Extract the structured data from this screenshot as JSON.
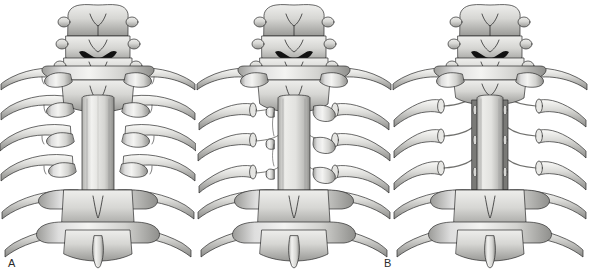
{
  "figure": {
    "background_color": "#ffffff",
    "ink_color": "#2b2b2b",
    "bone_light": "#f2f2f0",
    "bone_mid": "#c9c9c6",
    "bone_shadow": "#8d8d8a",
    "dark_fill": "#111111",
    "width": 589,
    "height": 278,
    "panel_count": 3
  },
  "panels": [
    {
      "id": "a",
      "label": "A",
      "caption": "Intact posterior thoracic spine with ribs and costotransverse joints",
      "ribs_per_side": 6,
      "vertebrae_visible": 8,
      "ribs_resected": false,
      "transverse_processes_removed": false,
      "nerve_roots_exposed": false,
      "central_structure": "spinous process column"
    },
    {
      "id": "b",
      "label": "B",
      "caption": "Ribs transected near the costotransverse joints leaving cut rib stumps",
      "ribs_per_side": 6,
      "vertebrae_visible": 8,
      "ribs_resected": true,
      "rib_stubs_per_side": 3,
      "transverse_processes_removed": false,
      "nerve_roots_exposed": true,
      "central_structure": "spinous process column"
    },
    {
      "id": "c",
      "label": "C",
      "caption": "Transverse processes and rib heads removed exposing nerve roots and lateral spinal canal",
      "ribs_per_side": 6,
      "vertebrae_visible": 8,
      "ribs_resected": true,
      "rib_stubs_per_side": 3,
      "transverse_processes_removed": true,
      "nerve_roots_exposed": true,
      "central_structure": "exposed dural tube / spinal canal"
    }
  ]
}
